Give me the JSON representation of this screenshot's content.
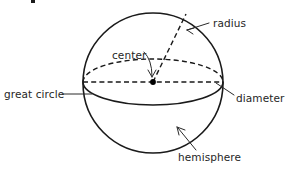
{
  "figure": {
    "type": "geometry-diagram",
    "subject": "sphere",
    "background_color": "#ffffff",
    "line_color": "#1a1a1a",
    "text_color": "#262626",
    "width": 292,
    "height": 173
  },
  "geometry": {
    "sphere_outline": {
      "name": "sphere-outline-circle",
      "center_x": 153,
      "center_y": 83,
      "radius": 70,
      "style": "solid"
    },
    "equator_ellipse": {
      "name": "equator-great-circle-ellipse",
      "center_x": 153,
      "center_y": 82,
      "rx": 70,
      "ry": 23,
      "upper_half_style": "dashed",
      "lower_half_style": "solid"
    },
    "diameter_line": {
      "name": "diameter-line",
      "x1": 83,
      "y1": 82,
      "x2": 223,
      "y2": 82,
      "style": "dashed"
    },
    "radius_line": {
      "name": "radius-line",
      "x1": 153,
      "y1": 82,
      "x2": 186,
      "y2": 14,
      "style": "dashed"
    },
    "center_point": {
      "name": "center-point-dot",
      "x": 153,
      "y": 82,
      "radius": 2.9
    }
  },
  "labels": {
    "radius": {
      "text": "radius",
      "x": 213,
      "y": 18,
      "leader_from_x": 209,
      "leader_from_y": 23,
      "leader_to_x": 186,
      "leader_to_y": 31
    },
    "center": {
      "text": "center",
      "x": 112,
      "y": 50,
      "leader_from_x": 146,
      "leader_from_y": 54,
      "leader_to_x": 151,
      "leader_to_y": 76
    },
    "great_circle": {
      "text": "great circle",
      "x": 4,
      "y": 89,
      "leader_from_x": 62,
      "leader_from_y": 94,
      "leader_to_x": 90,
      "leader_to_y": 94
    },
    "diameter": {
      "text": "diameter",
      "x": 236,
      "y": 93,
      "leader_from_x": 234,
      "leader_from_y": 95,
      "leader_to_x": 217,
      "leader_to_y": 84
    },
    "hemisphere": {
      "text": "hemisphere",
      "x": 178,
      "y": 152,
      "leader_from_x": 196,
      "leader_from_y": 150,
      "leader_to_x": 177,
      "leader_to_y": 128
    }
  },
  "artifacts": {
    "top_edge_mark": {
      "name": "clipped-text-fragment",
      "x": 31,
      "y": 0,
      "width": 4,
      "height": 3
    }
  }
}
